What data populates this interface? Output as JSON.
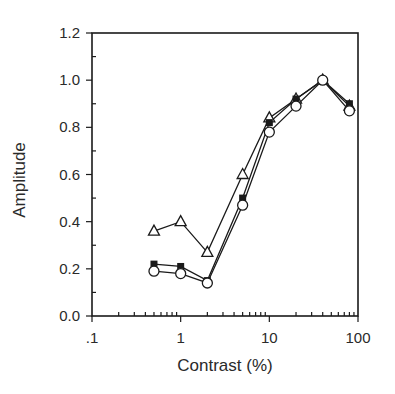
{
  "chart_data": {
    "type": "line",
    "title": "",
    "xlabel": "Contrast (%)",
    "ylabel": "Amplitude",
    "xscale": "log",
    "xlim": [
      0.1,
      100
    ],
    "ylim": [
      0.0,
      1.2
    ],
    "x_ticks": [
      ".1",
      "1",
      "10",
      "100"
    ],
    "y_ticks": [
      "0.0",
      "0.2",
      "0.4",
      "0.6",
      "0.8",
      "1.0",
      "1.2"
    ],
    "grid": false,
    "legend": null,
    "x": [
      0.5,
      1,
      2,
      5,
      10,
      20,
      40,
      80
    ],
    "series": [
      {
        "name": "open-triangle",
        "marker": "triangle-open",
        "values": [
          0.36,
          0.4,
          0.27,
          0.6,
          0.84,
          0.92,
          1.0,
          0.89
        ]
      },
      {
        "name": "filled-square",
        "marker": "square-filled",
        "values": [
          0.22,
          0.21,
          0.15,
          0.5,
          0.82,
          0.92,
          1.0,
          0.9
        ]
      },
      {
        "name": "open-circle",
        "marker": "circle-open",
        "values": [
          0.19,
          0.18,
          0.14,
          0.47,
          0.78,
          0.89,
          1.0,
          0.87
        ]
      }
    ]
  }
}
